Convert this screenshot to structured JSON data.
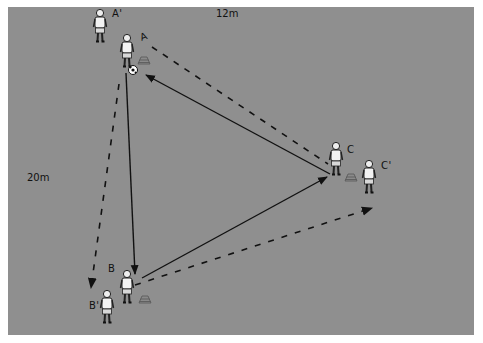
{
  "diagram": {
    "type": "soccer-passing-drill",
    "field_color": "#8f8f8f",
    "dimensions": {
      "width_label": "12m",
      "height_label": "20m"
    },
    "players": [
      {
        "id": "A",
        "label": "A",
        "x": 127,
        "y": 50,
        "has_ball": true
      },
      {
        "id": "A_prime",
        "label": "A'",
        "x": 100,
        "y": 25
      },
      {
        "id": "B",
        "label": "B",
        "x": 127,
        "y": 288
      },
      {
        "id": "B_prime",
        "label": "B'",
        "x": 107,
        "y": 305
      },
      {
        "id": "C",
        "label": "C",
        "x": 336,
        "y": 158
      },
      {
        "id": "C_prime",
        "label": "C'",
        "x": 369,
        "y": 175
      }
    ],
    "cones": [
      {
        "near": "A",
        "x": 144,
        "y": 61
      },
      {
        "near": "B",
        "x": 145,
        "y": 300
      },
      {
        "near": "C",
        "x": 351,
        "y": 178
      }
    ],
    "passes_solid": [
      {
        "from": "C",
        "to": "A"
      },
      {
        "from": "A",
        "to": "B"
      },
      {
        "from": "B",
        "to": "C"
      }
    ],
    "runs_dashed": [
      {
        "from": "A",
        "to": "C"
      },
      {
        "from": "A",
        "to": "B_prime"
      },
      {
        "from": "B",
        "to": "C_prime"
      }
    ]
  }
}
